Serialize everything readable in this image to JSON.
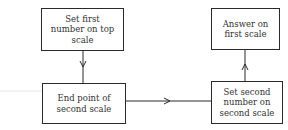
{
  "diagram": {
    "type": "flowchart",
    "nodes": [
      {
        "id": "n1",
        "lines": [
          "Set first",
          "number on top",
          "scale"
        ]
      },
      {
        "id": "n2",
        "lines": [
          "End point of",
          "second scale"
        ]
      },
      {
        "id": "n3",
        "lines": [
          "Set second",
          "number on",
          "second scale"
        ]
      },
      {
        "id": "n4",
        "lines": [
          "Answer on",
          "first scale"
        ]
      }
    ],
    "edges": [
      {
        "from": "n1",
        "to": "n2",
        "direction": "down"
      },
      {
        "from": "n2",
        "to": "n3",
        "direction": "right"
      },
      {
        "from": "n3",
        "to": "n4",
        "direction": "up"
      }
    ],
    "colors": {
      "line": "#2a2a2a",
      "text": "#333333",
      "background": "#ffffff"
    }
  }
}
